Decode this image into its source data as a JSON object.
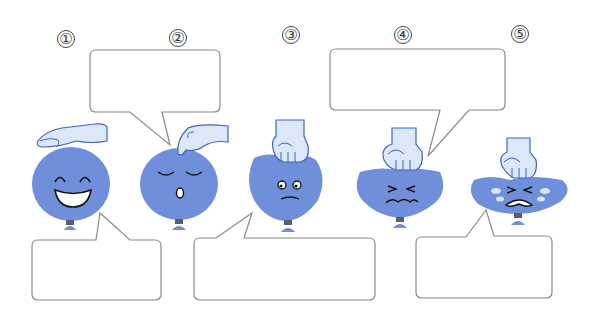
{
  "worksheet": {
    "colors": {
      "balloon": "#6f8fdb",
      "balloon_knot": "#5a5f6e",
      "hand_fill": "#dce8f8",
      "hand_stroke": "#3f63c4",
      "bubble_stroke": "#8a8a8a",
      "tear": "#d8e6fa"
    },
    "panels": [
      {
        "number": "①",
        "state": "hand hovering above",
        "face": "laughing",
        "bubble_text": ""
      },
      {
        "number": "②",
        "state": "finger touching top",
        "face": "calm-surprised",
        "bubble_text": ""
      },
      {
        "number": "③",
        "state": "fist pressing lightly",
        "face": "worried",
        "bubble_text": ""
      },
      {
        "number": "④",
        "state": "fist pressing harder",
        "face": "squinting-strained",
        "bubble_text": ""
      },
      {
        "number": "⑤",
        "state": "fist pressing hardest",
        "face": "crying",
        "bubble_text": ""
      }
    ]
  }
}
